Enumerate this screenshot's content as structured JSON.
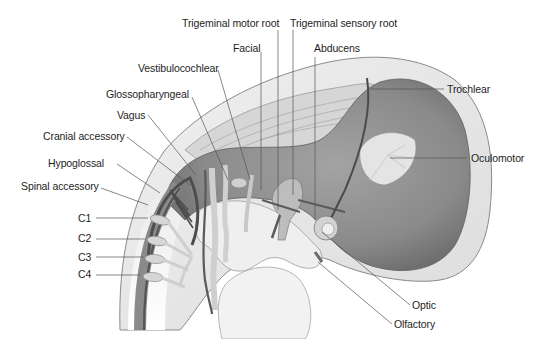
{
  "figure": {
    "colors": {
      "background": "#ffffff",
      "outer_layer": "#e6e6e6",
      "brain_mass": "#8e8e8e",
      "brain_dark": "#6f6f6f",
      "nerve_dark": "#4a4a4a",
      "nerve_light": "#d9d9d9",
      "leader_line": "#555555",
      "label_text": "#1e1e1e"
    },
    "labels": {
      "trigeminal_motor_root": "Trigeminal motor root",
      "trigeminal_sensory_root": "Trigeminal sensory root",
      "facial": "Facial",
      "abducens": "Abducens",
      "vestibulocochlear": "Vestibulocochlear",
      "glossopharyngeal": "Glossopharyngeal",
      "vagus": "Vagus",
      "cranial_accessory": "Cranial accessory",
      "hypoglossal": "Hypoglossal",
      "spinal_accessory": "Spinal accessory",
      "c1": "C1",
      "c2": "C2",
      "c3": "C3",
      "c4": "C4",
      "trochlear": "Trochlear",
      "oculomotor": "Oculomotor",
      "optic": "Optic",
      "olfactory": "Olfactory"
    }
  }
}
